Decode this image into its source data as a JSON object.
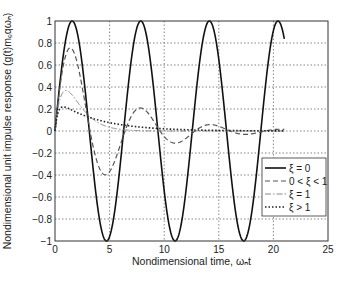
{
  "chart_data": {
    "type": "line",
    "title": "",
    "xlabel": "Nondimensional time, ωₙt",
    "ylabel": "Nondimensional unit impulse response (g(t)mₑqωₙ)",
    "xlim": [
      0,
      25
    ],
    "ylim": [
      -1,
      1
    ],
    "xticks": [
      0,
      5,
      10,
      15,
      20,
      25
    ],
    "xtick_labels": [
      "0",
      "5",
      "10",
      "15",
      "20",
      "25"
    ],
    "yticks": [
      -1,
      -0.8,
      -0.6,
      -0.4,
      -0.2,
      0,
      0.2,
      0.4,
      0.6,
      0.8,
      1
    ],
    "ytick_labels": [
      "−1",
      "−0.8",
      "−0.6",
      "−0.4",
      "−0.2",
      "0",
      "0.2",
      "0.4",
      "0.6",
      "0.8",
      "1"
    ],
    "grid": true,
    "legend_position": "lower right",
    "t_max": 21,
    "series": [
      {
        "name": "ξ = 0",
        "zeta": 0,
        "style": "solid",
        "color": "#111111",
        "description": "sin(t); peaks 1 at t≈1.57, 7.85, 14.1, 20.4; troughs -1 at t≈4.7, 11.0, 17.3"
      },
      {
        "name": "0 < ξ < 1",
        "zeta": 0.2,
        "style": "dashed",
        "color": "#555555",
        "description": "peak ≈0.76 at t≈1.4, trough ≈-0.37 at t≈4.6, peak ≈0.22 at t≈7.8"
      },
      {
        "name": "ξ = 1",
        "zeta": 1,
        "style": "dashdot",
        "color": "#888888",
        "description": "t·e^-t, peak ≈0.37 at t=1"
      },
      {
        "name": "ξ > 1",
        "zeta": 2,
        "style": "dotted",
        "color": "#222222",
        "description": "peak ≈0.22 at t≈0.76, slow decay"
      }
    ]
  }
}
